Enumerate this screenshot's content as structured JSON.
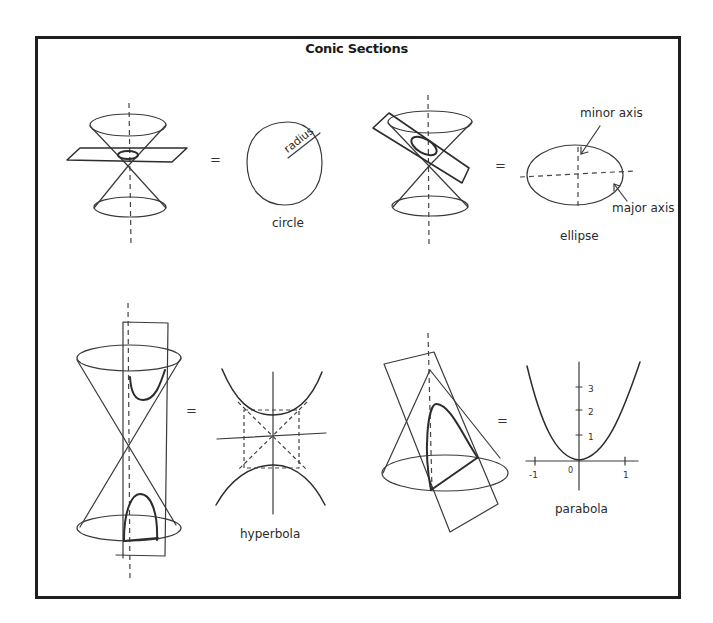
{
  "title": "Conic Sections",
  "panels": [
    {
      "id": "circle",
      "label": "circle",
      "equals": "=",
      "annotation": "radius"
    },
    {
      "id": "ellipse",
      "label": "ellipse",
      "equals": "=",
      "annotations": [
        "minor axis",
        "major axis"
      ]
    },
    {
      "id": "hyperbola",
      "label": "hyperbola",
      "equals": "="
    },
    {
      "id": "parabola",
      "label": "parabola",
      "equals": "=",
      "axis_ticks": {
        "y": [
          "1",
          "2",
          "3"
        ],
        "x": [
          "-1",
          "0",
          "1"
        ]
      }
    }
  ],
  "colors": {
    "ink": "#3a3a3a",
    "frame": "#1e1e1e",
    "background": "#ffffff"
  }
}
